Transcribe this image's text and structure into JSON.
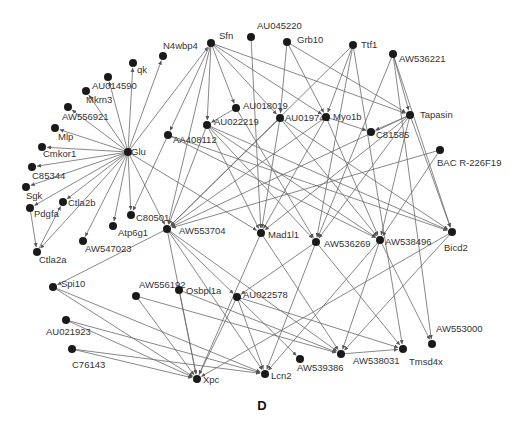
{
  "figure": {
    "panel_label": "D",
    "type": "directed gene regulatory network"
  },
  "nodes": [
    {
      "id": "Sfn",
      "label": "Sfn",
      "x": 211,
      "y": 43,
      "lx": 8,
      "ly": -4
    },
    {
      "id": "AU045220",
      "label": "AU045220",
      "x": 251,
      "y": 37,
      "lx": 6,
      "ly": -8
    },
    {
      "id": "Grb10",
      "label": "Grb10",
      "x": 287,
      "y": 42,
      "lx": 10,
      "ly": 1
    },
    {
      "id": "Ttf1",
      "label": "Ttf1",
      "x": 353,
      "y": 45,
      "lx": 8,
      "ly": 3
    },
    {
      "id": "AW536221",
      "label": "AW536221",
      "x": 393,
      "y": 54,
      "lx": 6,
      "ly": 8
    },
    {
      "id": "N4wbp4",
      "label": "N4wbp4",
      "x": 163,
      "y": 56,
      "lx": 0,
      "ly": -7
    },
    {
      "id": "qk",
      "label": "qk",
      "x": 133,
      "y": 63,
      "lx": 4,
      "ly": 10
    },
    {
      "id": "AU014590",
      "label": "AU014590",
      "x": 108,
      "y": 77,
      "lx": -16,
      "ly": 12
    },
    {
      "id": "Mkrn3",
      "label": "Mkrn3",
      "x": 86,
      "y": 91,
      "lx": 0,
      "ly": 12
    },
    {
      "id": "AW556921",
      "label": "AW556921",
      "x": 68,
      "y": 107,
      "lx": -6,
      "ly": 13
    },
    {
      "id": "Mlp",
      "label": "Mlp",
      "x": 55,
      "y": 128,
      "lx": 3,
      "ly": 12
    },
    {
      "id": "Cmkor1",
      "label": "Cmkor1",
      "x": 42,
      "y": 147,
      "lx": 1,
      "ly": 10
    },
    {
      "id": "C85344",
      "label": "C85344",
      "x": 32,
      "y": 167,
      "lx": 0,
      "ly": 12
    },
    {
      "id": "Sgk",
      "label": "Sgk",
      "x": 26,
      "y": 187,
      "lx": 0,
      "ly": 12
    },
    {
      "id": "Pdgfa",
      "label": "Pdgfa",
      "x": 30,
      "y": 208,
      "lx": 4,
      "ly": 9
    },
    {
      "id": "Ctla2b",
      "label": "Ctla2b",
      "x": 63,
      "y": 202,
      "lx": 5,
      "ly": 4
    },
    {
      "id": "Ctla2a",
      "label": "Ctla2a",
      "x": 37,
      "y": 252,
      "lx": 2,
      "ly": 11
    },
    {
      "id": "Glu",
      "label": "Glu",
      "x": 128,
      "y": 152,
      "lx": 3,
      "ly": 3
    },
    {
      "id": "AU018019",
      "label": "AU018019",
      "x": 236,
      "y": 108,
      "lx": 7,
      "ly": 1
    },
    {
      "id": "AU022219",
      "label": "AU022219",
      "x": 207,
      "y": 125,
      "lx": 7,
      "ly": 0
    },
    {
      "id": "AU019742",
      "label": "AU019742",
      "x": 280,
      "y": 118,
      "lx": 5,
      "ly": 3
    },
    {
      "id": "Myo1b",
      "label": "Myo1b",
      "x": 326,
      "y": 117,
      "lx": 7,
      "ly": 3
    },
    {
      "id": "AA408112",
      "label": "AA408112",
      "x": 168,
      "y": 135,
      "lx": 5,
      "ly": 8
    },
    {
      "id": "C81585",
      "label": "C81585",
      "x": 371,
      "y": 132,
      "lx": 5,
      "ly": 6
    },
    {
      "id": "Tapasin",
      "label": "Tapasin",
      "x": 410,
      "y": 115,
      "lx": 10,
      "ly": 3
    },
    {
      "id": "BAC_R-226F19",
      "label": "BAC R-226F19",
      "x": 440,
      "y": 150,
      "lx": -3,
      "ly": 16
    },
    {
      "id": "C80501",
      "label": "C80501",
      "x": 131,
      "y": 215,
      "lx": 5,
      "ly": 6
    },
    {
      "id": "Atp6g1",
      "label": "Atp6g1",
      "x": 113,
      "y": 226,
      "lx": 5,
      "ly": 10
    },
    {
      "id": "AW547023",
      "label": "AW547023",
      "x": 83,
      "y": 241,
      "lx": 2,
      "ly": 11
    },
    {
      "id": "AW553704",
      "label": "AW553704",
      "x": 167,
      "y": 229,
      "lx": 12,
      "ly": 5
    },
    {
      "id": "Mad1l1",
      "label": "Mad1l1",
      "x": 261,
      "y": 233,
      "lx": 7,
      "ly": 5
    },
    {
      "id": "AW536269",
      "label": "AW536269",
      "x": 316,
      "y": 242,
      "lx": 8,
      "ly": 5
    },
    {
      "id": "AW538496",
      "label": "AW538496",
      "x": 380,
      "y": 240,
      "lx": 5,
      "ly": 5
    },
    {
      "id": "Bicd2",
      "label": "Bicd2",
      "x": 452,
      "y": 232,
      "lx": -8,
      "ly": 19
    },
    {
      "id": "Spi10",
      "label": "Spi10",
      "x": 53,
      "y": 287,
      "lx": 8,
      "ly": 0
    },
    {
      "id": "AW556192",
      "label": "AW556192",
      "x": 136,
      "y": 296,
      "lx": 3,
      "ly": -8
    },
    {
      "id": "Osbpl1a",
      "label": "Osbpl1a",
      "x": 179,
      "y": 290,
      "lx": 7,
      "ly": 4
    },
    {
      "id": "AU022578",
      "label": "AU022578",
      "x": 237,
      "y": 297,
      "lx": 6,
      "ly": 1
    },
    {
      "id": "AU021923",
      "label": "AU021923",
      "x": 66,
      "y": 320,
      "lx": -20,
      "ly": 15
    },
    {
      "id": "C76143",
      "label": "C76143",
      "x": 72,
      "y": 349,
      "lx": 0,
      "ly": 19
    },
    {
      "id": "Xpc",
      "label": "Xpc",
      "x": 197,
      "y": 379,
      "lx": 6,
      "ly": 4
    },
    {
      "id": "Lcn2",
      "label": "Lcn2",
      "x": 265,
      "y": 374,
      "lx": 6,
      "ly": 5
    },
    {
      "id": "AW539386",
      "label": "AW539386",
      "x": 300,
      "y": 359,
      "lx": -3,
      "ly": 12
    },
    {
      "id": "AW538031",
      "label": "AW538031",
      "x": 341,
      "y": 354,
      "lx": 12,
      "ly": 10
    },
    {
      "id": "Tmsd4x",
      "label": "Tmsd4x",
      "x": 403,
      "y": 349,
      "lx": 6,
      "ly": 16
    },
    {
      "id": "AW553000",
      "label": "AW553000",
      "x": 432,
      "y": 344,
      "lx": 4,
      "ly": -12
    }
  ],
  "edges": [
    [
      "Glu",
      "N4wbp4"
    ],
    [
      "Glu",
      "qk"
    ],
    [
      "Glu",
      "AU014590"
    ],
    [
      "Glu",
      "Mkrn3"
    ],
    [
      "Glu",
      "AW556921"
    ],
    [
      "Glu",
      "Mlp"
    ],
    [
      "Glu",
      "Cmkor1"
    ],
    [
      "Glu",
      "C85344"
    ],
    [
      "Glu",
      "Sgk"
    ],
    [
      "Glu",
      "Pdgfa"
    ],
    [
      "Glu",
      "Ctla2b"
    ],
    [
      "Glu",
      "Ctla2a"
    ],
    [
      "Glu",
      "AW547023"
    ],
    [
      "Glu",
      "Atp6g1"
    ],
    [
      "Glu",
      "C80501"
    ],
    [
      "Glu",
      "AW553704"
    ],
    [
      "Glu",
      "Mad1l1"
    ],
    [
      "Glu",
      "Sfn"
    ],
    [
      "Pdgfa",
      "Ctla2a"
    ],
    [
      "Ctla2a",
      "Ctla2b"
    ],
    [
      "Sfn",
      "AA408112"
    ],
    [
      "Sfn",
      "AU022219"
    ],
    [
      "Sfn",
      "AU018019"
    ],
    [
      "Sfn",
      "AU019742"
    ],
    [
      "Sfn",
      "Myo1b"
    ],
    [
      "Sfn",
      "Tapasin"
    ],
    [
      "Sfn",
      "AW553704"
    ],
    [
      "AU045220",
      "Mad1l1"
    ],
    [
      "Grb10",
      "AU019742"
    ],
    [
      "Grb10",
      "Tapasin"
    ],
    [
      "Grb10",
      "Myo1b"
    ],
    [
      "Ttf1",
      "AW553704"
    ],
    [
      "Ttf1",
      "Myo1b"
    ],
    [
      "Ttf1",
      "AW536269"
    ],
    [
      "Ttf1",
      "Tmsd4x"
    ],
    [
      "AW536221",
      "Tapasin"
    ],
    [
      "AW536221",
      "Bicd2"
    ],
    [
      "AW536221",
      "AW536269"
    ],
    [
      "AW536221",
      "AW553000"
    ],
    [
      "AU018019",
      "AW536269"
    ],
    [
      "AU018019",
      "AU022219"
    ],
    [
      "AU022219",
      "AW553704"
    ],
    [
      "AU022219",
      "Mad1l1"
    ],
    [
      "AU022219",
      "AW536269"
    ],
    [
      "AU022219",
      "AW538496"
    ],
    [
      "AU022219",
      "Bicd2"
    ],
    [
      "AU019742",
      "AW553704"
    ],
    [
      "AU019742",
      "Mad1l1"
    ],
    [
      "AU019742",
      "AW538496"
    ],
    [
      "AU019742",
      "Bicd2"
    ],
    [
      "Myo1b",
      "C81585"
    ],
    [
      "Myo1b",
      "Mad1l1"
    ],
    [
      "Myo1b",
      "AW538496"
    ],
    [
      "Myo1b",
      "AW553704"
    ],
    [
      "AA408112",
      "C80501"
    ],
    [
      "AA408112",
      "AW538496"
    ],
    [
      "AA408112",
      "Bicd2"
    ],
    [
      "Tapasin",
      "C81585"
    ],
    [
      "Tapasin",
      "Mad1l1"
    ],
    [
      "Tapasin",
      "AW536269"
    ],
    [
      "Tapasin",
      "AW538496"
    ],
    [
      "Tapasin",
      "Bicd2"
    ],
    [
      "Tapasin",
      "AW553704"
    ],
    [
      "BAC_R-226F19",
      "AW553704"
    ],
    [
      "BAC_R-226F19",
      "AW538496"
    ],
    [
      "AW553704",
      "Xpc"
    ],
    [
      "AW553704",
      "Spi10"
    ],
    [
      "AW553704",
      "AU022578"
    ],
    [
      "AW553704",
      "Lcn2"
    ],
    [
      "AW553704",
      "AW538031"
    ],
    [
      "Mad1l1",
      "Xpc"
    ],
    [
      "Mad1l1",
      "AW538031"
    ],
    [
      "AW536269",
      "AU022578"
    ],
    [
      "AW536269",
      "Lcn2"
    ],
    [
      "AW536269",
      "Tmsd4x"
    ],
    [
      "AW538496",
      "Lcn2"
    ],
    [
      "AW538496",
      "AW538031"
    ],
    [
      "AW538496",
      "AW553000"
    ],
    [
      "Bicd2",
      "Xpc"
    ],
    [
      "Bicd2",
      "AW538031"
    ],
    [
      "AW556192",
      "Xpc"
    ],
    [
      "AW556192",
      "AW538031"
    ],
    [
      "Osbpl1a",
      "Xpc"
    ],
    [
      "Osbpl1a",
      "AW538031"
    ],
    [
      "AU022578",
      "Xpc"
    ],
    [
      "AU022578",
      "Lcn2"
    ],
    [
      "AU022578",
      "AW539386"
    ],
    [
      "AU022578",
      "Tmsd4x"
    ],
    [
      "Spi10",
      "Xpc"
    ],
    [
      "Spi10",
      "Lcn2"
    ],
    [
      "AU021923",
      "Xpc"
    ],
    [
      "AU021923",
      "Lcn2"
    ],
    [
      "C76143",
      "Xpc"
    ],
    [
      "C76143",
      "Lcn2"
    ],
    [
      "AW538031",
      "Tmsd4x"
    ]
  ]
}
